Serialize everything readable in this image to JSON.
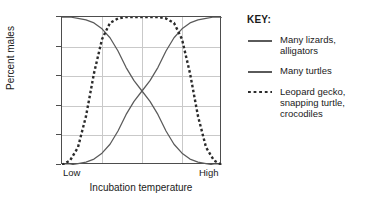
{
  "chart_data": {
    "type": "line",
    "title": "",
    "xlabel": "Incubation temperature",
    "ylabel": "Percent males",
    "xlim": [
      0,
      100
    ],
    "ylim": [
      0,
      100
    ],
    "x_tick_labels": [
      "Low",
      "High"
    ],
    "y_tick_labels": [
      "0",
      "20",
      "40",
      "60",
      "80",
      "100"
    ],
    "y_ticks": [
      0,
      20,
      40,
      60,
      80,
      100
    ],
    "grid": "horizontal gridlines at every y tick; 3 internal vertical gridlines",
    "vertical_gridlines_x": [
      25,
      50,
      75
    ],
    "legend_position": "right",
    "series": [
      {
        "name": "Many lizards, alligators",
        "style": "solid",
        "color": "#5a5a5a",
        "x": [
          0,
          5,
          10,
          15,
          20,
          25,
          30,
          35,
          40,
          45,
          50,
          55,
          60,
          65,
          70,
          75,
          80,
          85,
          90,
          95,
          100
        ],
        "values": [
          100,
          100,
          99,
          98,
          96,
          92,
          86,
          77,
          66,
          57,
          50,
          43,
          34,
          23,
          14,
          8,
          4,
          2,
          1,
          0,
          0
        ]
      },
      {
        "name": "Many turtles",
        "style": "solid",
        "color": "#5a5a5a",
        "x": [
          0,
          5,
          10,
          15,
          20,
          25,
          30,
          35,
          40,
          45,
          50,
          55,
          60,
          65,
          70,
          75,
          80,
          85,
          90,
          95,
          100
        ],
        "values": [
          0,
          0,
          1,
          2,
          4,
          8,
          14,
          23,
          34,
          43,
          50,
          57,
          66,
          77,
          86,
          92,
          96,
          98,
          99,
          100,
          100
        ]
      },
      {
        "name": "Leopard gecko, snapping turtle, crocodiles",
        "style": "dashed",
        "color": "#2b2b2b",
        "x": [
          0,
          5,
          10,
          15,
          20,
          25,
          30,
          35,
          40,
          45,
          50,
          55,
          60,
          65,
          70,
          75,
          80,
          85,
          90,
          95,
          100
        ],
        "values": [
          0,
          3,
          12,
          33,
          62,
          85,
          96,
          99,
          100,
          100,
          100,
          100,
          100,
          99,
          96,
          85,
          62,
          33,
          12,
          3,
          0
        ]
      }
    ]
  },
  "axis": {
    "y_title": "Percent males",
    "x_title": "Incubation temperature",
    "y_labels": [
      "100",
      "80",
      "60",
      "40",
      "20",
      "0"
    ],
    "x_low_label": "Low",
    "x_high_label": "High"
  },
  "legend": {
    "title": "KEY:",
    "entries": [
      {
        "label_line1": "Many lizards,",
        "label_line2": "alligators",
        "label_line3": "",
        "style": "solid"
      },
      {
        "label_line1": "Many turtles",
        "label_line2": "",
        "label_line3": "",
        "style": "solid"
      },
      {
        "label_line1": "Leopard gecko,",
        "label_line2": "snapping turtle,",
        "label_line3": "crocodiles",
        "style": "dashed"
      }
    ]
  },
  "colors": {
    "solid_line": "#5a5a5a",
    "dashed_line": "#2b2b2b",
    "grid": "#c9c9c9",
    "frame": "#4d4d4d",
    "background": "#ffffff"
  }
}
